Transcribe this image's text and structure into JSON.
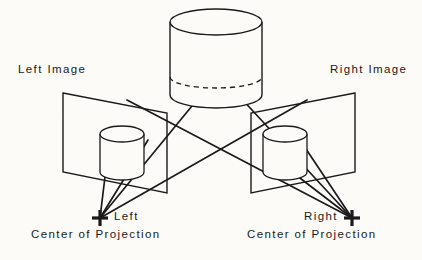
{
  "figure": {
    "background_color": "#fcfbf8",
    "stroke_color": "#1a1a1a",
    "width": 422,
    "height": 260
  },
  "labels": {
    "left_image": "Left Image",
    "right_image": "Right Image",
    "left_cop_name": "Left",
    "right_cop_name": "Right",
    "left_cop_caption": "Center of Projection",
    "right_cop_caption": "Center of Projection"
  },
  "geometry": {
    "scene_cylinder": {
      "name": "scene-cylinder",
      "center_x": 216,
      "top_ellipse_cy": 22,
      "rx": 46,
      "ry": 13,
      "bottom_ellipse_cy": 95,
      "hidden_ellipse_cy": 77,
      "hidden_ellipse_rx": 46,
      "hidden_ellipse_ry": 11
    },
    "left_image_plane": {
      "name": "left-image-plane",
      "corners": [
        [
          63,
          93
        ],
        [
          167,
          113
        ],
        [
          167,
          193
        ],
        [
          63,
          172
        ]
      ]
    },
    "right_image_plane": {
      "name": "right-image-plane",
      "corners": [
        [
          355,
          93
        ],
        [
          251,
          113
        ],
        [
          251,
          193
        ],
        [
          355,
          172
        ]
      ]
    },
    "left_projected_cylinder": {
      "name": "left-projected-cylinder",
      "center_x": 122,
      "top_ellipse_cy": 134,
      "rx": 22,
      "ry": 8,
      "bottom_ellipse_cy": 172
    },
    "right_projected_cylinder": {
      "name": "right-projected-cylinder",
      "center_x": 285,
      "top_ellipse_cy": 134,
      "rx": 22,
      "ry": 8,
      "bottom_ellipse_cy": 172
    },
    "left_center_of_projection": {
      "name": "left-cop-marker",
      "x": 100,
      "y": 218
    },
    "right_center_of_projection": {
      "name": "right-cop-marker",
      "x": 352,
      "y": 218
    },
    "projection_rays": [
      {
        "name": "ray-left-cop-to-scene-left",
        "from": [
          100,
          218
        ],
        "to": [
          256,
          28
        ]
      },
      {
        "name": "ray-left-cop-to-scene-right",
        "from": [
          100,
          218
        ],
        "to": [
          307,
          100
        ]
      },
      {
        "name": "ray-right-cop-to-scene-right",
        "from": [
          352,
          218
        ],
        "to": [
          176,
          28
        ]
      },
      {
        "name": "ray-right-cop-to-scene-left",
        "from": [
          352,
          218
        ],
        "to": [
          127,
          100
        ]
      },
      {
        "name": "ray-left-cop-to-plane-a",
        "from": [
          100,
          218
        ],
        "to": [
          148,
          140
        ]
      },
      {
        "name": "ray-left-cop-to-plane-b",
        "from": [
          100,
          218
        ],
        "to": [
          108,
          152
        ]
      },
      {
        "name": "ray-right-cop-to-plane-a",
        "from": [
          352,
          218
        ],
        "to": [
          300,
          140
        ]
      },
      {
        "name": "ray-right-cop-to-plane-b",
        "from": [
          352,
          218
        ],
        "to": [
          266,
          152
        ]
      }
    ]
  }
}
